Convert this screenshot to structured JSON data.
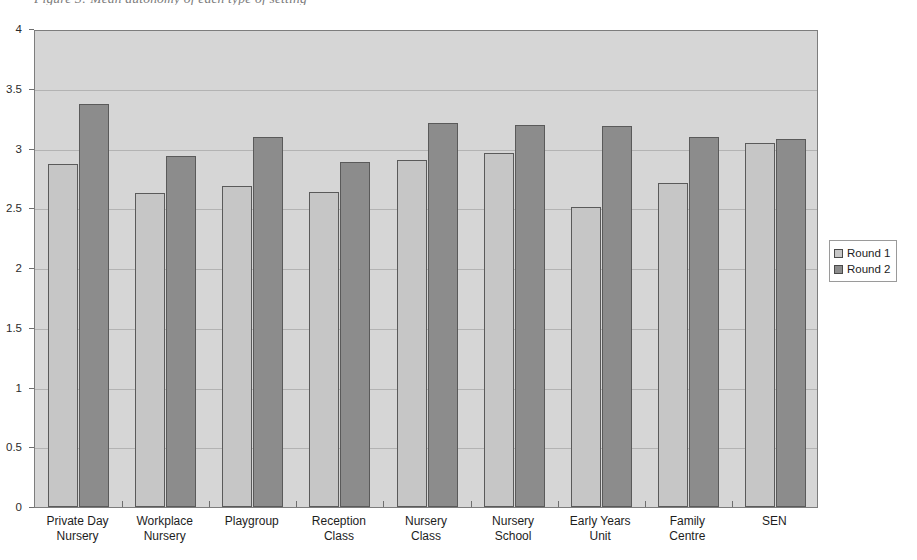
{
  "caption": "Figure 3: Mean autonomy of each type of setting",
  "legend": {
    "position": "right",
    "entries": [
      {
        "label": "Round 1",
        "color": "#c6c6c6"
      },
      {
        "label": "Round 2",
        "color": "#8c8c8c"
      }
    ]
  },
  "axis": {
    "y_ticks": [
      "0",
      "0.5",
      "1",
      "1.5",
      "2",
      "2.5",
      "3",
      "3.5",
      "4"
    ]
  },
  "chart_data": {
    "type": "bar",
    "title": "Figure 3: Mean autonomy of each type of setting",
    "xlabel": "",
    "ylabel": "",
    "ylim": [
      0,
      4
    ],
    "ytick_step": 0.5,
    "grid": true,
    "legend_position": "right",
    "categories": [
      "Private Day\nNursery",
      "Workplace\nNursery",
      "Playgroup",
      "Reception\nClass",
      "Nursery\nClass",
      "Nursery\nSchool",
      "Early Years\nUnit",
      "Family\nCentre",
      "SEN"
    ],
    "series": [
      {
        "name": "Round 1",
        "color": "#c6c6c6",
        "values": [
          2.87,
          2.63,
          2.69,
          2.64,
          2.9,
          2.96,
          2.51,
          2.71,
          3.05
        ]
      },
      {
        "name": "Round 2",
        "color": "#8c8c8c",
        "values": [
          3.37,
          2.94,
          3.1,
          2.89,
          3.21,
          3.2,
          3.19,
          3.1,
          3.08
        ]
      }
    ]
  }
}
